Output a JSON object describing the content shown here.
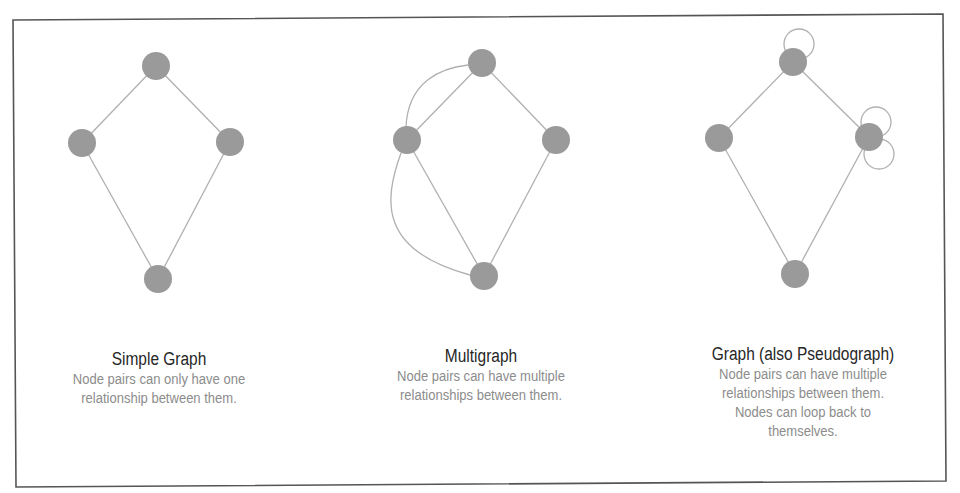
{
  "figure": {
    "frame": {
      "points": [
        [
          13,
          20
        ],
        [
          943,
          14
        ],
        [
          946,
          481
        ],
        [
          16,
          487
        ]
      ],
      "stroke": "#555555"
    },
    "style": {
      "node_fill": "#9a9a9a",
      "node_radius": 14,
      "edge_stroke": "#b0b0b0",
      "edge_width": 1.3,
      "title_color": "#262626",
      "desc_color": "#8c8c8c"
    },
    "panels": [
      {
        "id": "simple-graph",
        "title": "Simple Graph",
        "description_lines": [
          "Node pairs can only have one",
          "relationship between them."
        ],
        "caption_center_x": 159,
        "caption_top": 349,
        "nodes": [
          {
            "id": "top",
            "x": 156,
            "y": 66
          },
          {
            "id": "left",
            "x": 82,
            "y": 143
          },
          {
            "id": "right",
            "x": 230,
            "y": 142
          },
          {
            "id": "bottom",
            "x": 158,
            "y": 279
          }
        ],
        "edges": [
          {
            "from": "top",
            "to": "left",
            "type": "line"
          },
          {
            "from": "top",
            "to": "right",
            "type": "line"
          },
          {
            "from": "left",
            "to": "bottom",
            "type": "line"
          },
          {
            "from": "right",
            "to": "bottom",
            "type": "line"
          }
        ],
        "loops": []
      },
      {
        "id": "multigraph",
        "title": "Multigraph",
        "description_lines": [
          "Node pairs can have multiple",
          "relationships between them."
        ],
        "caption_center_x": 481,
        "caption_top": 346,
        "nodes": [
          {
            "id": "top",
            "x": 482,
            "y": 63
          },
          {
            "id": "left",
            "x": 407,
            "y": 140
          },
          {
            "id": "right",
            "x": 556,
            "y": 140
          },
          {
            "id": "bottom",
            "x": 484,
            "y": 276
          }
        ],
        "edges": [
          {
            "from": "top",
            "to": "left",
            "type": "line"
          },
          {
            "from": "top",
            "to": "right",
            "type": "line"
          },
          {
            "from": "left",
            "to": "bottom",
            "type": "line"
          },
          {
            "from": "right",
            "to": "bottom",
            "type": "line"
          },
          {
            "from": "top",
            "to": "left",
            "type": "curve",
            "path": "M 468 65 C 440 68, 408 82, 406 127"
          },
          {
            "from": "left",
            "to": "bottom",
            "type": "curve",
            "path": "M 401 153 C 384 200, 378 250, 470 275"
          }
        ],
        "loops": []
      },
      {
        "id": "pseudograph",
        "title": "Graph (also Pseudograph)",
        "description_lines": [
          "Node pairs can have multiple",
          "relationships between them.",
          "Nodes can loop back to",
          "themselves."
        ],
        "caption_center_x": 803,
        "caption_top": 344,
        "nodes": [
          {
            "id": "top",
            "x": 793,
            "y": 62
          },
          {
            "id": "left",
            "x": 719,
            "y": 138
          },
          {
            "id": "right",
            "x": 869,
            "y": 137
          },
          {
            "id": "bottom",
            "x": 795,
            "y": 274
          }
        ],
        "edges": [
          {
            "from": "top",
            "to": "left",
            "type": "line"
          },
          {
            "from": "top",
            "to": "right",
            "type": "line"
          },
          {
            "from": "left",
            "to": "bottom",
            "type": "line"
          },
          {
            "from": "right",
            "to": "bottom",
            "type": "line"
          }
        ],
        "loops": [
          {
            "node": "top",
            "cx": 799,
            "cy": 44,
            "r": 15
          },
          {
            "node": "right",
            "cx": 876,
            "cy": 122,
            "r": 15
          },
          {
            "node": "right",
            "cx": 879,
            "cy": 154,
            "r": 15
          }
        ]
      }
    ]
  }
}
